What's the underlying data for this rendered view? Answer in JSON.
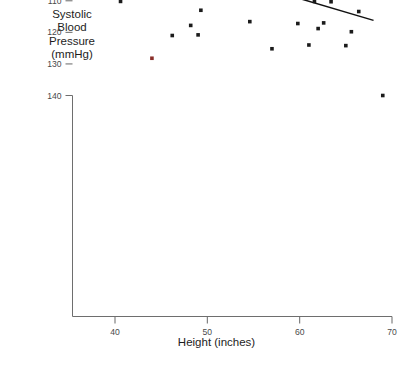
{
  "axis_titles": {
    "y": "Systolic\nBlood\nPressure\n(mmHg)",
    "x": "Height (inches)"
  },
  "edge_caption": "",
  "chart_data": {
    "type": "scatter",
    "title": "",
    "xlabel": "Height (inches)",
    "ylabel": "Systolic Blood Pressure (mmHg)",
    "xlim": [
      35.5,
      70.5
    ],
    "ylim": [
      68,
      143
    ],
    "xticks": [
      40,
      50,
      60,
      70
    ],
    "yticks": [
      70,
      80,
      90,
      100,
      110,
      120,
      130,
      140
    ],
    "grid": false,
    "legend": false,
    "marker": "square",
    "marker_color": "#1b1b1b",
    "highlight_color": "#8a2f2a",
    "points": [
      {
        "x": 36.6,
        "y": 105.0
      },
      {
        "x": 36.9,
        "y": 89.6
      },
      {
        "x": 37.2,
        "y": 89.2
      },
      {
        "x": 38.4,
        "y": 82.2
      },
      {
        "x": 39.2,
        "y": 82.1
      },
      {
        "x": 39.0,
        "y": 74.1
      },
      {
        "x": 39.5,
        "y": 98.0
      },
      {
        "x": 40.3,
        "y": 104.0
      },
      {
        "x": 40.6,
        "y": 110.2
      },
      {
        "x": 41.2,
        "y": 81.8
      },
      {
        "x": 42.0,
        "y": 93.8
      },
      {
        "x": 42.6,
        "y": 108.2
      },
      {
        "x": 43.0,
        "y": 89.0
      },
      {
        "x": 43.4,
        "y": 86.4
      },
      {
        "x": 44.0,
        "y": 128.2,
        "highlight": true
      },
      {
        "x": 44.5,
        "y": 95.2
      },
      {
        "x": 45.5,
        "y": 102.5
      },
      {
        "x": 46.2,
        "y": 121.0
      },
      {
        "x": 46.8,
        "y": 77.8
      },
      {
        "x": 47.3,
        "y": 108.5
      },
      {
        "x": 47.9,
        "y": 104.3
      },
      {
        "x": 48.2,
        "y": 117.8
      },
      {
        "x": 48.6,
        "y": 82.0
      },
      {
        "x": 49.0,
        "y": 120.8
      },
      {
        "x": 49.3,
        "y": 113.0
      },
      {
        "x": 49.6,
        "y": 74.0
      },
      {
        "x": 50.1,
        "y": 81.5
      },
      {
        "x": 50.6,
        "y": 99.3
      },
      {
        "x": 51.0,
        "y": 90.0
      },
      {
        "x": 51.2,
        "y": 88.0
      },
      {
        "x": 51.8,
        "y": 102.2
      },
      {
        "x": 53.0,
        "y": 94.9
      },
      {
        "x": 54.6,
        "y": 116.6
      },
      {
        "x": 55.1,
        "y": 103.8
      },
      {
        "x": 55.6,
        "y": 83.0
      },
      {
        "x": 56.5,
        "y": 90.6
      },
      {
        "x": 57.0,
        "y": 125.2
      },
      {
        "x": 57.6,
        "y": 106.1
      },
      {
        "x": 58.4,
        "y": 98.8
      },
      {
        "x": 59.2,
        "y": 107.4
      },
      {
        "x": 59.8,
        "y": 117.2
      },
      {
        "x": 60.4,
        "y": 88.2
      },
      {
        "x": 61.0,
        "y": 124.0
      },
      {
        "x": 61.6,
        "y": 110.2
      },
      {
        "x": 62.0,
        "y": 118.8
      },
      {
        "x": 62.6,
        "y": 117.0
      },
      {
        "x": 63.4,
        "y": 110.3
      },
      {
        "x": 64.2,
        "y": 89.0
      },
      {
        "x": 65.0,
        "y": 124.2
      },
      {
        "x": 65.6,
        "y": 119.8
      },
      {
        "x": 66.4,
        "y": 113.4
      },
      {
        "x": 67.0,
        "y": 94.2
      },
      {
        "x": 69.0,
        "y": 140.0
      }
    ],
    "fit_line": {
      "x0": 36.5,
      "y0": 89.0,
      "x1": 68.0,
      "y1": 116.2
    }
  }
}
